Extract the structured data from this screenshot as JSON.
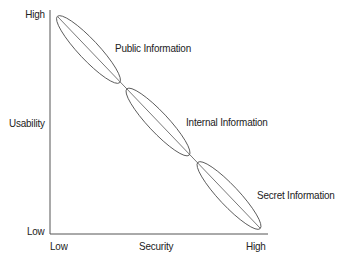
{
  "diagram": {
    "type": "tradeoff-diagram",
    "y_axis": {
      "label": "Usability",
      "high": "High",
      "low": "Low"
    },
    "x_axis": {
      "label": "Security",
      "low": "Low",
      "high": "High"
    },
    "regions": [
      {
        "label": "Public Information",
        "order": 1
      },
      {
        "label": "Internal Information",
        "order": 2
      },
      {
        "label": "Secret Information",
        "order": 3
      }
    ],
    "colors": {
      "line": "#555555",
      "text": "#222222",
      "background": "#ffffff"
    }
  }
}
